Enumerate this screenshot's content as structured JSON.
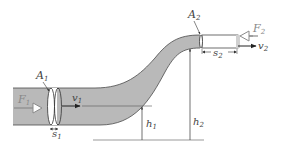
{
  "diagram": {
    "colors": {
      "fluid": "#b9b9b9",
      "outline": "#4a4a4a",
      "background": "#ffffff",
      "text": "#444444",
      "force_arrow": "#bcbcbc"
    },
    "labels": {
      "A1": {
        "main": "A",
        "sub": "1"
      },
      "A2": {
        "main": "A",
        "sub": "2"
      },
      "F1": {
        "main": "F",
        "sub": "1"
      },
      "F2": {
        "main": "F",
        "sub": "2"
      },
      "v1": {
        "main": "v",
        "sub": "1"
      },
      "v2": {
        "main": "v",
        "sub": "2"
      },
      "s1": {
        "main": "s",
        "sub": "1"
      },
      "s2": {
        "main": "s",
        "sub": "2"
      },
      "h1": {
        "main": "h",
        "sub": "1"
      },
      "h2": {
        "main": "h",
        "sub": "2"
      }
    }
  }
}
